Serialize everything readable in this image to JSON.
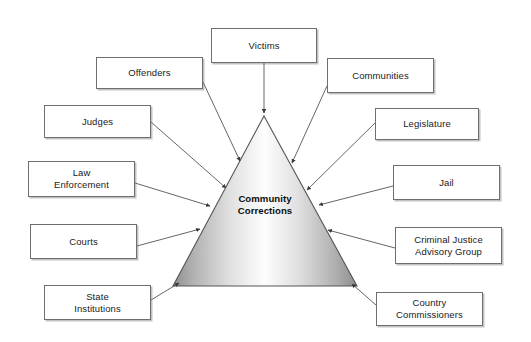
{
  "diagram": {
    "center": {
      "label": "Community\nCorrections",
      "shape": "triangle",
      "apex": [
        264,
        116
      ],
      "base_left": [
        173,
        286
      ],
      "base_right": [
        357,
        286
      ],
      "fill_light": "#fbfbfb",
      "fill_dark": "#8d8d8d",
      "stroke": "#555555"
    },
    "canvas": {
      "width": 531,
      "height": 342,
      "background": "#ffffff"
    },
    "arrow_color": "#4a4a4a",
    "box_border_color": "#6f6f6f",
    "nodes": [
      {
        "id": "victims",
        "label": "Victims",
        "x": 211,
        "y": 28,
        "w": 106,
        "h": 35,
        "arrow_from": [
          264,
          63
        ],
        "arrow_to": [
          264,
          113
        ]
      },
      {
        "id": "offenders",
        "label": "Offenders",
        "x": 96,
        "y": 57,
        "w": 107,
        "h": 32,
        "arrow_from": [
          203,
          82
        ],
        "arrow_to": [
          240,
          161
        ]
      },
      {
        "id": "communities",
        "label": "Communities",
        "x": 327,
        "y": 58,
        "w": 107,
        "h": 35,
        "arrow_from": [
          327,
          86
        ],
        "arrow_to": [
          292,
          163
        ]
      },
      {
        "id": "judges",
        "label": "Judges",
        "x": 44,
        "y": 105,
        "w": 107,
        "h": 33,
        "arrow_from": [
          151,
          122
        ],
        "arrow_to": [
          226,
          188
        ]
      },
      {
        "id": "legislature",
        "label": "Legislature",
        "x": 375,
        "y": 108,
        "w": 104,
        "h": 32,
        "arrow_from": [
          375,
          123
        ],
        "arrow_to": [
          307,
          190
        ]
      },
      {
        "id": "law-enforcement",
        "label": "Law\nEnforcement",
        "x": 28,
        "y": 161,
        "w": 107,
        "h": 36,
        "arrow_from": [
          135,
          183
        ],
        "arrow_to": [
          210,
          206
        ]
      },
      {
        "id": "jail",
        "label": "Jail",
        "x": 393,
        "y": 165,
        "w": 107,
        "h": 35,
        "arrow_from": [
          393,
          186
        ],
        "arrow_to": [
          319,
          205
        ]
      },
      {
        "id": "courts",
        "label": "Courts",
        "x": 30,
        "y": 224,
        "w": 107,
        "h": 35,
        "arrow_from": [
          137,
          246
        ],
        "arrow_to": [
          200,
          229
        ]
      },
      {
        "id": "criminal-justice-advisory-group",
        "label": "Criminal Justice\nAdvisory Group",
        "x": 395,
        "y": 227,
        "w": 107,
        "h": 37,
        "arrow_from": [
          395,
          248
        ],
        "arrow_to": [
          328,
          230
        ]
      },
      {
        "id": "state-institutions",
        "label": "State\nInstitutions",
        "x": 44,
        "y": 285,
        "w": 107,
        "h": 35,
        "arrow_from": [
          151,
          300
        ],
        "arrow_to": [
          179,
          283
        ]
      },
      {
        "id": "country-commissioners",
        "label": "Country\nCommissioners",
        "x": 376,
        "y": 292,
        "w": 107,
        "h": 34,
        "arrow_from": [
          376,
          305
        ],
        "arrow_to": [
          352,
          284
        ]
      }
    ]
  }
}
